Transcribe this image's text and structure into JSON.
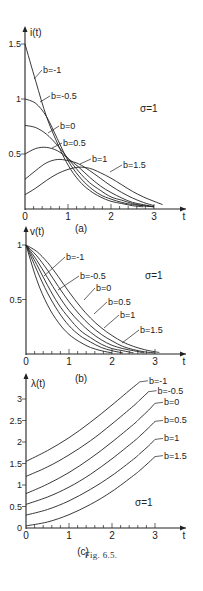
{
  "caption": "Fig. 6.5.",
  "chart_data": [
    {
      "type": "line",
      "panel_label": "(a)",
      "ylabel": "i(t)",
      "xlabel": "t",
      "annotation": "σ=1",
      "xlim": [
        0,
        3.3
      ],
      "ylim": [
        0,
        1.6
      ],
      "xticks": [
        "0",
        "1",
        "2",
        "3"
      ],
      "xtick_values": [
        0,
        1,
        2,
        3
      ],
      "yticks": [
        "0.5",
        "1",
        "1.5"
      ],
      "ytick_values": [
        0.5,
        1,
        1.5
      ],
      "x": [
        0,
        0.25,
        0.5,
        0.75,
        1.0,
        1.25,
        1.5,
        1.75,
        2.0,
        2.25,
        2.5,
        2.75,
        3.0,
        3.2
      ],
      "series": [
        {
          "name": "b=-1",
          "values": [
            1.5,
            1.16,
            0.84,
            0.6,
            0.4,
            0.26,
            0.17,
            0.11,
            0.07,
            0.05,
            0.03,
            0.02,
            null,
            null
          ]
        },
        {
          "name": "b=-0.5",
          "values": [
            1.0,
            0.96,
            0.84,
            0.64,
            0.44,
            0.3,
            0.2,
            0.13,
            0.09,
            0.06,
            0.04,
            0.03,
            0.02,
            null
          ]
        },
        {
          "name": "b=0",
          "values": [
            0.76,
            0.74,
            0.68,
            0.58,
            0.46,
            0.34,
            0.24,
            0.17,
            0.11,
            0.08,
            0.05,
            0.03,
            0.02,
            null
          ]
        },
        {
          "name": "b=0.5",
          "values": [
            0.5,
            0.55,
            0.56,
            0.53,
            0.46,
            0.38,
            0.29,
            0.21,
            0.15,
            0.1,
            0.06,
            0.04,
            0.02,
            null
          ]
        },
        {
          "name": "b=1",
          "values": [
            0.27,
            0.35,
            0.42,
            0.45,
            0.44,
            0.41,
            0.35,
            0.28,
            0.21,
            0.15,
            0.1,
            0.06,
            0.03,
            null
          ]
        },
        {
          "name": "b=1.5",
          "values": [
            0.13,
            0.19,
            0.26,
            0.32,
            0.36,
            0.38,
            0.37,
            0.33,
            0.28,
            0.22,
            0.16,
            0.11,
            0.07,
            0.04
          ]
        }
      ]
    },
    {
      "type": "line",
      "panel_label": "(b)",
      "ylabel": "v(t)",
      "xlabel": "t",
      "annotation": "σ=1",
      "xlim": [
        0,
        3.3
      ],
      "ylim": [
        0,
        1.05
      ],
      "xticks": [
        "0",
        "1",
        "2",
        "3"
      ],
      "xtick_values": [
        0,
        1,
        2,
        3
      ],
      "yticks": [
        "0.5",
        "1"
      ],
      "ytick_values": [
        0.5,
        1
      ],
      "x": [
        0,
        0.25,
        0.5,
        0.75,
        1.0,
        1.25,
        1.5,
        1.75,
        2.0,
        2.25,
        2.5,
        2.75,
        3.0,
        3.1
      ],
      "series": [
        {
          "name": "b=-1",
          "values": [
            1.0,
            0.68,
            0.45,
            0.29,
            0.18,
            0.11,
            0.06,
            0.03,
            0.01,
            null,
            null,
            null,
            null,
            null
          ]
        },
        {
          "name": "b=-0.5",
          "values": [
            1.0,
            0.77,
            0.56,
            0.39,
            0.26,
            0.17,
            0.11,
            0.06,
            0.03,
            0.01,
            null,
            null,
            null,
            null
          ]
        },
        {
          "name": "b=0",
          "values": [
            1.0,
            0.82,
            0.63,
            0.46,
            0.33,
            0.22,
            0.15,
            0.09,
            0.05,
            0.03,
            0.01,
            null,
            null,
            null
          ]
        },
        {
          "name": "b=0.5",
          "values": [
            1.0,
            0.86,
            0.7,
            0.54,
            0.4,
            0.29,
            0.2,
            0.13,
            0.08,
            0.05,
            0.03,
            0.01,
            null,
            null
          ]
        },
        {
          "name": "b=1",
          "values": [
            1.0,
            0.9,
            0.77,
            0.62,
            0.48,
            0.36,
            0.26,
            0.18,
            0.12,
            0.07,
            0.04,
            0.02,
            0.01,
            null
          ]
        },
        {
          "name": "b=1.5",
          "values": [
            1.0,
            0.94,
            0.84,
            0.71,
            0.57,
            0.44,
            0.33,
            0.24,
            0.17,
            0.11,
            0.07,
            0.04,
            0.02,
            0.015
          ]
        }
      ]
    },
    {
      "type": "line",
      "panel_label": "(c)",
      "ylabel": "λ(t)",
      "xlabel": "t",
      "annotation": "σ=1",
      "xlim": [
        0,
        3.3
      ],
      "ylim": [
        0,
        3.2
      ],
      "xticks": [
        "0",
        "1",
        "2",
        "3"
      ],
      "xtick_values": [
        0,
        1,
        2,
        3
      ],
      "yticks": [
        "0",
        "0.5",
        "1",
        "1.5",
        "2",
        "2.5",
        "3"
      ],
      "ytick_values": [
        0,
        0.5,
        1,
        1.5,
        2,
        2.5,
        3
      ],
      "x": [
        0,
        0.5,
        1.0,
        1.5,
        2.0,
        2.5,
        2.65,
        2.85,
        3.0
      ],
      "series": [
        {
          "name": "b=-1",
          "values": [
            1.55,
            1.8,
            2.1,
            2.46,
            2.86,
            3.28,
            3.4,
            null,
            null
          ]
        },
        {
          "name": "b=-0.5",
          "values": [
            1.2,
            1.42,
            1.7,
            2.03,
            2.42,
            2.84,
            2.98,
            3.17,
            null
          ]
        },
        {
          "name": "b=0",
          "values": [
            0.8,
            1.02,
            1.29,
            1.62,
            2.0,
            2.41,
            2.55,
            2.74,
            2.9
          ]
        },
        {
          "name": "b=0.5",
          "values": [
            0.55,
            0.72,
            0.95,
            1.25,
            1.61,
            2.01,
            2.14,
            2.33,
            2.48
          ]
        },
        {
          "name": "b=1",
          "values": [
            0.3,
            0.43,
            0.63,
            0.9,
            1.22,
            1.6,
            1.73,
            1.91,
            2.06
          ]
        },
        {
          "name": "b=1.5",
          "values": [
            0.05,
            0.14,
            0.31,
            0.55,
            0.85,
            1.22,
            1.34,
            1.52,
            1.66
          ]
        }
      ]
    }
  ]
}
